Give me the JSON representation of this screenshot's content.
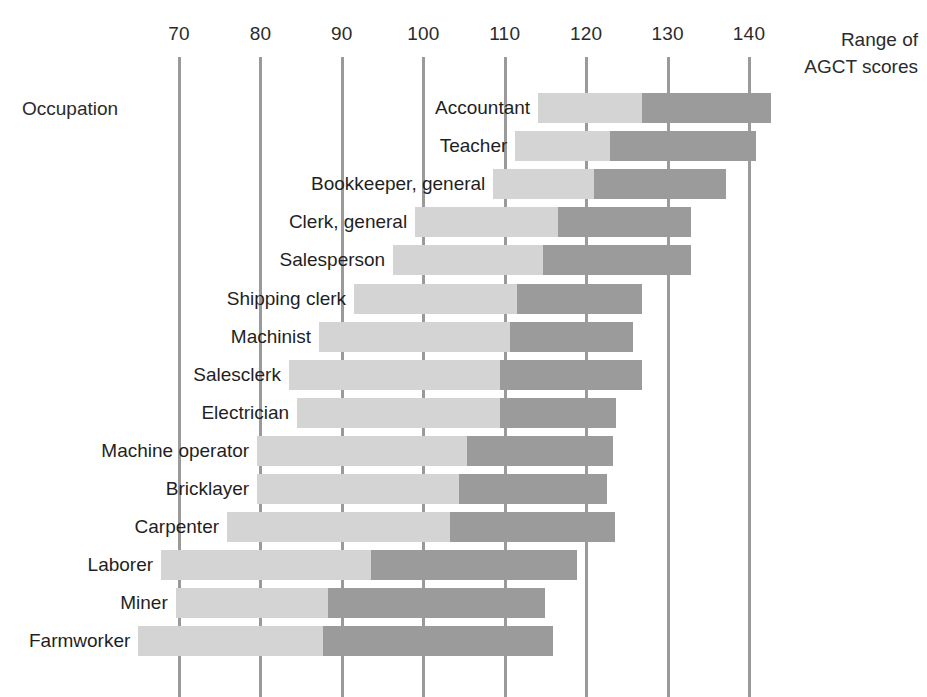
{
  "labels": {
    "corner": "Occupation",
    "axis_title_line1": "Range of",
    "axis_title_line2": "AGCT scores"
  },
  "colors": {
    "light_segment": "#d4d4d4",
    "dark_segment": "#9b9b9b",
    "gridline": "#9a9a9a",
    "text": "#1f1f1f",
    "background": "#ffffff"
  },
  "chart_data": {
    "type": "bar",
    "subtype": "range-bar-stacked",
    "title": "",
    "xlabel": "Range of AGCT scores",
    "ylabel": "Occupation",
    "xlim": [
      60,
      150
    ],
    "grid": true,
    "legend_position": "none",
    "tick_values": [
      70,
      80,
      90,
      100,
      110,
      120,
      130,
      140
    ],
    "tick_labels": [
      "70",
      "80",
      "90",
      "100",
      "110",
      "120",
      "130",
      "140"
    ],
    "categories": [
      "Accountant",
      "Teacher",
      "Bookkeeper, general",
      "Clerk, general",
      "Salesperson",
      "Shipping clerk",
      "Machinist",
      "Salesclerk",
      "Electrician",
      "Machine operator",
      "Bricklayer",
      "Carpenter",
      "Laborer",
      "Miner",
      "Farmworker"
    ],
    "series": [
      {
        "name": "lower range (start to median)",
        "color": "#d4d4d4",
        "values": [
          [
            114.1,
            126.8
          ],
          [
            111.3,
            122.9
          ],
          [
            108.6,
            121.0
          ],
          [
            99.0,
            116.5
          ],
          [
            96.3,
            114.7
          ],
          [
            91.5,
            111.5
          ],
          [
            87.2,
            110.6
          ],
          [
            83.5,
            109.4
          ],
          [
            84.5,
            109.4
          ],
          [
            79.6,
            105.4
          ],
          [
            79.6,
            104.4
          ],
          [
            75.9,
            103.3
          ],
          [
            67.8,
            93.6
          ],
          [
            69.6,
            88.3
          ],
          [
            65.0,
            87.7
          ]
        ]
      },
      {
        "name": "upper range (median to end)",
        "color": "#9b9b9b",
        "values": [
          [
            126.8,
            142.7
          ],
          [
            122.9,
            140.9
          ],
          [
            121.0,
            137.2
          ],
          [
            116.5,
            132.9
          ],
          [
            114.7,
            132.9
          ],
          [
            111.5,
            126.8
          ],
          [
            110.6,
            125.7
          ],
          [
            109.4,
            126.9
          ],
          [
            109.4,
            123.7
          ],
          [
            105.4,
            123.3
          ],
          [
            104.4,
            122.6
          ],
          [
            103.3,
            123.5
          ],
          [
            93.6,
            118.9
          ],
          [
            88.3,
            114.9
          ],
          [
            87.7,
            115.9
          ]
        ]
      }
    ],
    "ranges": [
      {
        "occupation": "Accountant",
        "start": 114.1,
        "split": 126.8,
        "end": 142.7
      },
      {
        "occupation": "Teacher",
        "start": 111.3,
        "split": 122.9,
        "end": 140.9
      },
      {
        "occupation": "Bookkeeper, general",
        "start": 108.6,
        "split": 121.0,
        "end": 137.2
      },
      {
        "occupation": "Clerk, general",
        "start": 99.0,
        "split": 116.5,
        "end": 132.9
      },
      {
        "occupation": "Salesperson",
        "start": 96.3,
        "split": 114.7,
        "end": 132.9
      },
      {
        "occupation": "Shipping clerk",
        "start": 91.5,
        "split": 111.5,
        "end": 126.8
      },
      {
        "occupation": "Machinist",
        "start": 87.2,
        "split": 110.6,
        "end": 125.7
      },
      {
        "occupation": "Salesclerk",
        "start": 83.5,
        "split": 109.4,
        "end": 126.9
      },
      {
        "occupation": "Electrician",
        "start": 84.5,
        "split": 109.4,
        "end": 123.7
      },
      {
        "occupation": "Machine operator",
        "start": 79.6,
        "split": 105.4,
        "end": 123.3
      },
      {
        "occupation": "Bricklayer",
        "start": 79.6,
        "split": 104.4,
        "end": 122.6
      },
      {
        "occupation": "Carpenter",
        "start": 75.9,
        "split": 103.3,
        "end": 123.5
      },
      {
        "occupation": "Laborer",
        "start": 67.8,
        "split": 93.6,
        "end": 118.9
      },
      {
        "occupation": "Miner",
        "start": 69.6,
        "split": 88.3,
        "end": 114.9
      },
      {
        "occupation": "Farmworker",
        "start": 65.0,
        "split": 87.7,
        "end": 115.9
      }
    ]
  },
  "geometry": {
    "x_at_70": 179,
    "px_per_unit": 8.143,
    "row_top_first": 93,
    "row_pitch": 38.1,
    "row_height": 30,
    "gridline_top": 57,
    "gridline_bottom": 697,
    "label_gap": 8
  }
}
